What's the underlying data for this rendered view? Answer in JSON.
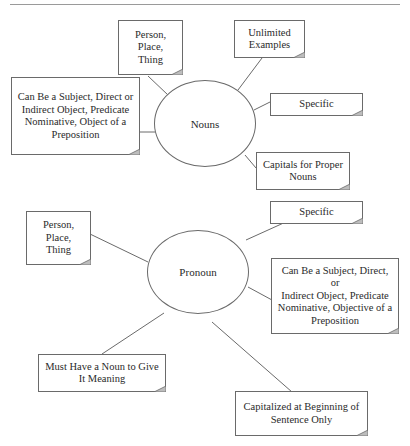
{
  "diagram": {
    "nouns": {
      "center_label": "Nouns",
      "notes": [
        {
          "id": "person-place-thing",
          "text": "Person,\nPlace,\nThing"
        },
        {
          "id": "unlimited-examples",
          "text": "Unlimited\nExamples"
        },
        {
          "id": "specific",
          "text": "Specific"
        },
        {
          "id": "grammatical-roles",
          "text": "Can Be a Subject, Direct or\nIndirect Object, Predicate\nNominative, Object of a\nPreposition"
        },
        {
          "id": "capitals",
          "text": "Capitals for Proper\nNouns"
        }
      ]
    },
    "pronoun": {
      "center_label": "Pronoun",
      "notes": [
        {
          "id": "person-place-thing",
          "text": "Person,\nPlace,\nThing"
        },
        {
          "id": "specific",
          "text": "Specific"
        },
        {
          "id": "grammatical-roles",
          "text": "Can Be a Subject, Direct, or\nIndirect Object, Predicate\nNominative, Objective of a\nPreposition"
        },
        {
          "id": "needs-noun",
          "text": "Must Have a Noun to Give\nIt Meaning"
        },
        {
          "id": "capitalized",
          "text": "Capitalized at Beginning of\nSentence Only"
        }
      ]
    }
  },
  "colors": {
    "stroke": "#6a6a6a",
    "text": "#2a2a2a",
    "fold": "#bdbdbd"
  }
}
